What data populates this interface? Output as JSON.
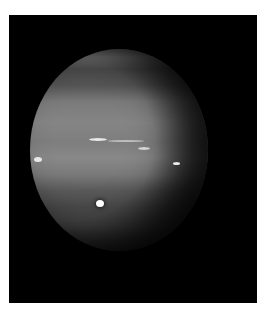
{
  "image": {
    "subject": "planet-neptune",
    "description": "Grayscale image of a banded planet with bright cloud streaks and a bright spot against a black background",
    "colors": {
      "border": "#ffffff",
      "background": "#000000",
      "planet_mid": "#808080"
    }
  }
}
